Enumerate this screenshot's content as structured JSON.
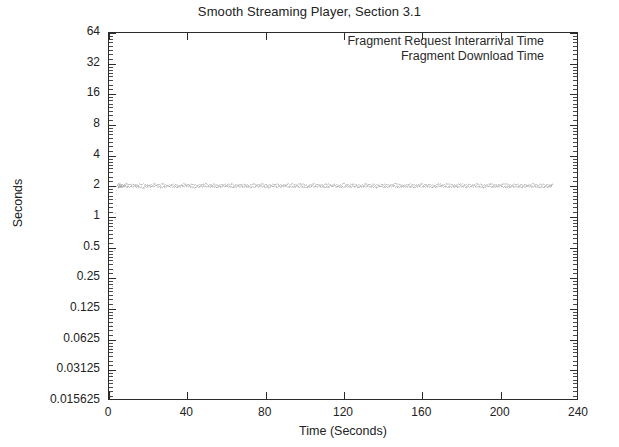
{
  "chart_data": {
    "type": "scatter",
    "title": "Smooth Streaming Player, Section 3.1",
    "xlabel": "Time (Seconds)",
    "ylabel": "Seconds",
    "xlim": [
      0,
      240
    ],
    "ylim": [
      0.015625,
      64
    ],
    "yscale": "log2",
    "grid": false,
    "legend_position": "top-right-inside",
    "xticks": [
      0,
      40,
      80,
      120,
      160,
      200,
      240
    ],
    "xtick_labels": [
      "0",
      "40",
      "80",
      "120",
      "160",
      "200",
      "240"
    ],
    "yticks": [
      64,
      32,
      16,
      8,
      4,
      2,
      1,
      0.5,
      0.25,
      0.125,
      0.0625,
      0.03125,
      0.015625
    ],
    "ytick_labels": [
      "64",
      "32",
      "16",
      "8",
      "4",
      "2",
      "1",
      "0.5",
      "0.25",
      "0.125",
      "0.0625",
      "0.03125",
      "0.015625"
    ],
    "series": [
      {
        "name": "Fragment Request Interarrival Time",
        "color": "#9a9a9a",
        "marker": "dot",
        "points": [
          [
            0.4,
            0.019
          ],
          [
            0.7,
            0.031
          ],
          [
            1.0,
            0.052
          ],
          [
            1.2,
            0.088
          ],
          [
            1.5,
            0.13
          ],
          [
            1.7,
            0.21
          ],
          [
            2.0,
            0.36
          ],
          [
            2.2,
            0.55
          ],
          [
            2.5,
            0.78
          ],
          [
            2.8,
            1.1
          ],
          [
            3.1,
            1.5
          ],
          [
            3.4,
            1.85
          ],
          [
            3.8,
            2.0
          ],
          [
            4.2,
            2.05
          ],
          [
            4.8,
            1.98
          ],
          [
            5.6,
            2.02
          ],
          [
            6.4,
            2.0
          ],
          [
            7.6,
            2.04
          ],
          [
            9.2,
            1.99
          ],
          [
            11.0,
            2.01
          ],
          [
            13.1,
            2.03
          ],
          [
            15.0,
            2.0
          ],
          [
            17.2,
            1.97
          ],
          [
            19.4,
            2.02
          ],
          [
            21.6,
            2.0
          ],
          [
            23.8,
            2.05
          ],
          [
            26.0,
            1.98
          ],
          [
            28.3,
            2.01
          ],
          [
            30.5,
            2.03
          ],
          [
            32.7,
            2.0
          ],
          [
            34.9,
            1.99
          ],
          [
            37.1,
            2.02
          ],
          [
            39.3,
            2.04
          ],
          [
            41.5,
            2.0
          ],
          [
            43.7,
            1.98
          ],
          [
            45.9,
            2.01
          ],
          [
            48.1,
            2.03
          ],
          [
            50.3,
            2.0
          ],
          [
            52.5,
            2.02
          ],
          [
            54.7,
            1.99
          ],
          [
            56.9,
            2.01
          ],
          [
            59.1,
            2.04
          ],
          [
            61.3,
            2.0
          ],
          [
            63.5,
            1.98
          ],
          [
            65.7,
            2.02
          ],
          [
            67.9,
            2.0
          ],
          [
            70.1,
            2.03
          ],
          [
            72.3,
            1.99
          ],
          [
            74.5,
            2.01
          ],
          [
            76.7,
            2.02
          ],
          [
            78.9,
            2.0
          ],
          [
            81.1,
            1.98
          ],
          [
            83.3,
            2.04
          ],
          [
            85.5,
            2.0
          ],
          [
            87.7,
            2.01
          ],
          [
            89.9,
            2.03
          ],
          [
            92.1,
            1.99
          ],
          [
            94.3,
            2.0
          ],
          [
            96.5,
            2.02
          ],
          [
            98.7,
            2.01
          ],
          [
            100.9,
            1.98
          ],
          [
            103.1,
            2.03
          ],
          [
            105.3,
            2.0
          ],
          [
            107.5,
            2.02
          ],
          [
            109.7,
            1.99
          ],
          [
            111.9,
            2.01
          ],
          [
            114.1,
            2.04
          ],
          [
            116.3,
            2.0
          ],
          [
            118.5,
            1.98
          ],
          [
            120.7,
            2.02
          ],
          [
            122.9,
            2.0
          ],
          [
            125.1,
            2.03
          ],
          [
            127.3,
            1.99
          ],
          [
            129.5,
            2.01
          ],
          [
            131.7,
            2.02
          ],
          [
            133.9,
            2.0
          ],
          [
            136.1,
            1.97
          ],
          [
            138.3,
            2.04
          ],
          [
            140.5,
            2.0
          ],
          [
            142.7,
            2.01
          ],
          [
            144.9,
            2.03
          ],
          [
            147.1,
            1.99
          ],
          [
            149.3,
            2.0
          ],
          [
            151.5,
            2.02
          ],
          [
            153.7,
            2.01
          ],
          [
            155.9,
            1.98
          ],
          [
            158.1,
            2.03
          ],
          [
            160.3,
            2.0
          ],
          [
            162.5,
            2.02
          ],
          [
            164.7,
            1.99
          ],
          [
            166.9,
            2.01
          ],
          [
            169.1,
            2.04
          ],
          [
            171.3,
            2.0
          ],
          [
            173.5,
            1.98
          ],
          [
            175.7,
            2.02
          ],
          [
            177.9,
            2.0
          ],
          [
            180.1,
            2.03
          ],
          [
            182.3,
            1.99
          ],
          [
            184.5,
            2.01
          ],
          [
            186.7,
            2.02
          ],
          [
            188.9,
            2.0
          ],
          [
            191.1,
            1.98
          ],
          [
            193.3,
            2.04
          ],
          [
            195.5,
            2.0
          ],
          [
            197.7,
            2.01
          ],
          [
            199.9,
            2.03
          ],
          [
            202.1,
            1.99
          ],
          [
            204.3,
            2.0
          ],
          [
            206.5,
            2.02
          ],
          [
            208.7,
            2.01
          ],
          [
            210.9,
            1.98
          ],
          [
            213.1,
            2.03
          ],
          [
            215.3,
            2.0
          ],
          [
            217.5,
            2.02
          ],
          [
            219.7,
            1.99
          ],
          [
            221.9,
            2.01
          ],
          [
            224.1,
            2.0
          ],
          [
            225.6,
            2.02
          ]
        ]
      },
      {
        "name": "Fragment Download Time",
        "color": "#a8a8a8",
        "marker": "dot",
        "points": [
          [
            0.5,
            0.017
          ],
          [
            0.8,
            0.028
          ],
          [
            1.1,
            0.045
          ],
          [
            1.4,
            0.072
          ],
          [
            1.6,
            0.115
          ],
          [
            1.9,
            0.18
          ],
          [
            2.1,
            0.3
          ],
          [
            2.4,
            0.47
          ],
          [
            2.7,
            0.7
          ],
          [
            3.0,
            0.95
          ],
          [
            3.3,
            1.3
          ],
          [
            3.6,
            1.7
          ],
          [
            4.0,
            2.1
          ],
          [
            4.5,
            2.15
          ],
          [
            5.2,
            2.08
          ],
          [
            6.0,
            2.12
          ],
          [
            7.0,
            2.06
          ],
          [
            8.4,
            2.14
          ],
          [
            10.1,
            2.09
          ],
          [
            12.0,
            2.11
          ],
          [
            14.0,
            2.07
          ],
          [
            16.1,
            2.13
          ],
          [
            18.3,
            2.1
          ],
          [
            20.5,
            2.06
          ],
          [
            22.7,
            2.12
          ],
          [
            24.9,
            2.09
          ],
          [
            27.1,
            2.14
          ],
          [
            29.3,
            2.07
          ],
          [
            31.5,
            2.11
          ],
          [
            33.7,
            2.1
          ],
          [
            35.9,
            2.05
          ],
          [
            38.1,
            2.13
          ],
          [
            40.3,
            2.09
          ],
          [
            42.5,
            2.12
          ],
          [
            44.7,
            2.07
          ],
          [
            46.9,
            2.1
          ],
          [
            49.1,
            2.14
          ],
          [
            51.3,
            2.08
          ],
          [
            53.5,
            2.11
          ],
          [
            55.7,
            2.06
          ],
          [
            57.9,
            2.12
          ],
          [
            60.1,
            2.09
          ],
          [
            62.3,
            2.13
          ],
          [
            64.5,
            2.07
          ],
          [
            66.7,
            2.1
          ],
          [
            68.9,
            2.11
          ],
          [
            71.1,
            2.05
          ],
          [
            73.3,
            2.14
          ],
          [
            75.5,
            2.08
          ],
          [
            77.7,
            2.12
          ],
          [
            79.9,
            2.09
          ],
          [
            82.1,
            2.06
          ],
          [
            84.3,
            2.13
          ],
          [
            86.5,
            2.1
          ],
          [
            88.7,
            2.07
          ],
          [
            90.9,
            2.11
          ],
          [
            93.1,
            2.12
          ],
          [
            95.3,
            2.08
          ],
          [
            97.5,
            2.14
          ],
          [
            99.7,
            2.09
          ],
          [
            101.9,
            2.06
          ],
          [
            104.1,
            2.12
          ],
          [
            106.3,
            2.1
          ],
          [
            108.5,
            2.07
          ],
          [
            110.7,
            2.13
          ],
          [
            112.9,
            2.09
          ],
          [
            115.1,
            2.11
          ],
          [
            117.3,
            2.05
          ],
          [
            119.5,
            2.14
          ],
          [
            121.7,
            2.08
          ],
          [
            123.9,
            2.12
          ],
          [
            126.1,
            2.1
          ],
          [
            128.3,
            2.06
          ],
          [
            130.5,
            2.13
          ],
          [
            132.7,
            2.09
          ],
          [
            134.9,
            2.11
          ],
          [
            137.1,
            2.07
          ],
          [
            139.3,
            2.12
          ],
          [
            141.5,
            2.1
          ],
          [
            143.7,
            2.08
          ],
          [
            145.9,
            2.14
          ],
          [
            148.1,
            2.09
          ],
          [
            150.3,
            2.06
          ],
          [
            152.5,
            2.12
          ],
          [
            154.7,
            2.11
          ],
          [
            156.9,
            2.07
          ],
          [
            159.1,
            2.13
          ],
          [
            161.3,
            2.09
          ],
          [
            163.5,
            2.1
          ],
          [
            165.7,
            2.05
          ],
          [
            167.9,
            2.14
          ],
          [
            170.1,
            2.08
          ],
          [
            172.3,
            2.12
          ],
          [
            174.5,
            2.1
          ],
          [
            176.7,
            2.06
          ],
          [
            178.9,
            2.13
          ],
          [
            181.1,
            2.09
          ],
          [
            183.3,
            2.11
          ],
          [
            185.5,
            2.07
          ],
          [
            187.7,
            2.12
          ],
          [
            189.9,
            2.1
          ],
          [
            192.1,
            2.08
          ],
          [
            194.3,
            2.14
          ],
          [
            196.5,
            2.09
          ],
          [
            198.7,
            2.06
          ],
          [
            200.9,
            2.12
          ],
          [
            203.1,
            2.11
          ],
          [
            205.3,
            2.07
          ],
          [
            207.5,
            2.13
          ],
          [
            209.7,
            2.09
          ],
          [
            211.9,
            2.1
          ],
          [
            214.1,
            2.05
          ],
          [
            216.3,
            2.14
          ],
          [
            218.5,
            2.08
          ],
          [
            220.7,
            2.12
          ],
          [
            222.9,
            2.1
          ],
          [
            225.1,
            2.07
          ],
          [
            226.2,
            2.11
          ]
        ]
      }
    ]
  }
}
